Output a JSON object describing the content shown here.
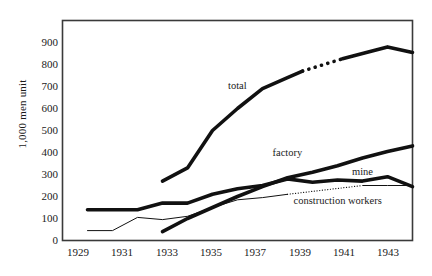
{
  "chart_data": {
    "type": "line",
    "title": "",
    "xlabel": "",
    "ylabel": "1,000 men unit",
    "xlim": [
      1929,
      1943
    ],
    "ylim": [
      0,
      950
    ],
    "yticks": [
      0,
      100,
      200,
      300,
      400,
      500,
      600,
      700,
      800,
      900
    ],
    "xticks": [
      1929,
      1931,
      1933,
      1935,
      1937,
      1939,
      1941,
      1943
    ],
    "grid": false,
    "legend_position": "inline-annotations",
    "series": [
      {
        "name": "total",
        "style": "thick-solid-with-dotted-gap",
        "x": [
          1933,
          1934,
          1935,
          1936,
          1937,
          1938,
          1939,
          1940,
          1941,
          1942,
          1943
        ],
        "values": [
          270,
          330,
          500,
          600,
          690,
          740,
          790,
          820,
          850,
          880,
          855
        ],
        "dotted_segment_x": [
          1938.6,
          1940.2
        ]
      },
      {
        "name": "factory",
        "style": "thick-solid",
        "x": [
          1933,
          1934,
          1935,
          1936,
          1937,
          1938,
          1939,
          1940,
          1941,
          1942,
          1943
        ],
        "values": [
          40,
          100,
          150,
          200,
          245,
          285,
          310,
          340,
          375,
          405,
          430
        ]
      },
      {
        "name": "mine",
        "style": "thick-solid",
        "x": [
          1930,
          1931,
          1932,
          1933,
          1934,
          1935,
          1936,
          1937,
          1938,
          1939,
          1940,
          1941,
          1942,
          1943
        ],
        "values": [
          140,
          140,
          140,
          170,
          170,
          210,
          235,
          250,
          280,
          265,
          275,
          270,
          290,
          245
        ]
      },
      {
        "name": "construction workers",
        "style": "thin-solid-with-dotted",
        "x": [
          1930,
          1931,
          1932,
          1933,
          1934,
          1935,
          1936,
          1937,
          1938,
          1939,
          1940,
          1941,
          1942,
          1943
        ],
        "values": [
          45,
          45,
          105,
          95,
          110,
          150,
          185,
          195,
          210,
          240,
          250,
          250,
          250,
          250
        ],
        "dotted_segment_x": [
          1938,
          1941
        ]
      }
    ],
    "annotations": [
      {
        "text": "total",
        "x": 1936.0,
        "y": 700
      },
      {
        "text": "factory",
        "x": 1938.0,
        "y": 395
      },
      {
        "text": "mine",
        "x": 1941.0,
        "y": 305
      },
      {
        "text": "construction workers",
        "x": 1940.0,
        "y": 175
      }
    ]
  }
}
